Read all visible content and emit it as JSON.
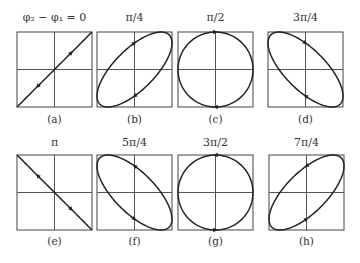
{
  "figure": {
    "panels": [
      {
        "id": "a",
        "title": "φ₂ − φ₁ = 0",
        "label": "(a)",
        "phase_over_pi": 0,
        "shape": "line",
        "arrows": "both-directions"
      },
      {
        "id": "b",
        "title": "π/4",
        "label": "(b)",
        "phase_over_pi": 0.25,
        "shape": "ellipse",
        "arrows": "clockwise"
      },
      {
        "id": "c",
        "title": "π/2",
        "label": "(c)",
        "phase_over_pi": 0.5,
        "shape": "circle",
        "arrows": "clockwise"
      },
      {
        "id": "d",
        "title": "3π/4",
        "label": "(d)",
        "phase_over_pi": 0.75,
        "shape": "ellipse",
        "arrows": "clockwise"
      },
      {
        "id": "e",
        "title": "π",
        "label": "(e)",
        "phase_over_pi": 1,
        "shape": "line",
        "arrows": "both-directions"
      },
      {
        "id": "f",
        "title": "5π/4",
        "label": "(f)",
        "phase_over_pi": 1.25,
        "shape": "ellipse",
        "arrows": "counterclockwise"
      },
      {
        "id": "g",
        "title": "3π/2",
        "label": "(g)",
        "phase_over_pi": 1.5,
        "shape": "circle",
        "arrows": "counterclockwise"
      },
      {
        "id": "h",
        "title": "7π/4",
        "label": "(h)",
        "phase_over_pi": 1.75,
        "shape": "ellipse",
        "arrows": "counterclockwise"
      }
    ],
    "colors": {
      "curve": "#222222",
      "frame": "#555555",
      "text": "#333333",
      "background": "#ffffff"
    }
  }
}
